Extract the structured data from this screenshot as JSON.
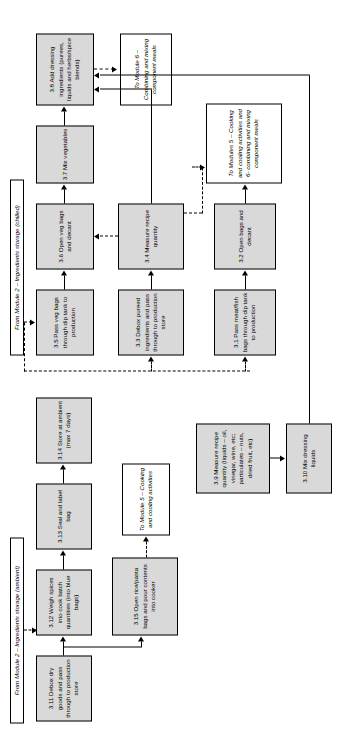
{
  "diagram": {
    "headers": [
      {
        "id": "hdr-ambient",
        "text": "From Module 2 – Ingredients storage (ambient)"
      },
      {
        "id": "hdr-chilled",
        "text": "From Module 2 – Ingredients storage (chilled)"
      }
    ],
    "nodes": [
      {
        "id": "n3-1",
        "label": "3.1 Pass meat/fish bags through dip tank to production"
      },
      {
        "id": "n3-2",
        "label": "3.2 Open bags and decant"
      },
      {
        "id": "n3-3",
        "label": "3.3 Debox pureed ingredients and pass through to production store"
      },
      {
        "id": "n3-4",
        "label": "3.4 Measure recipe quantity"
      },
      {
        "id": "n3-5",
        "label": "3.5 Pass veg bags through dip tank to production"
      },
      {
        "id": "n3-6",
        "label": "3.6 Open veg bags and decant"
      },
      {
        "id": "n3-7",
        "label": "3.7 Mix vegetables"
      },
      {
        "id": "n3-8",
        "label": "3.8 Add dressing ingredients (purees, liquids and herbs/spice blends)"
      },
      {
        "id": "n3-9",
        "label": "3.9 Measure recipe quantity (liquids – oil, vinegar, wine, etc; particulates – nuts, dried fruit, etc)"
      },
      {
        "id": "n3-10",
        "label": "3.10 Mix dressing liquids"
      },
      {
        "id": "n3-11",
        "label": "3.11 Debox dry goods and pass through to production store"
      },
      {
        "id": "n3-12",
        "label": "3.12 Weigh spices into cook batch quantities (into blue bags)"
      },
      {
        "id": "n3-13",
        "label": "3.13 Seal and label bag"
      },
      {
        "id": "n3-14",
        "label": "3.14 Store at ambient (max 7 days)"
      },
      {
        "id": "n3-15",
        "label": "3.15 Open rice/pasta bags and pour contents into cooker"
      }
    ],
    "exits": [
      {
        "id": "exit-m5",
        "text": "To Module 5 – Cooking and cooling activities"
      },
      {
        "id": "exit-m6",
        "text": "To Module 6 – Combining and mixing component meals"
      },
      {
        "id": "exit-m56",
        "text": "To Modules 5 – Cooking and cooling activities and 6- combining and mixing component meals"
      }
    ],
    "colors": {
      "process_fill": "#d9d9d9",
      "terminal_fill": "#ffffff",
      "stroke": "#000000",
      "page": "#ffffff"
    }
  }
}
